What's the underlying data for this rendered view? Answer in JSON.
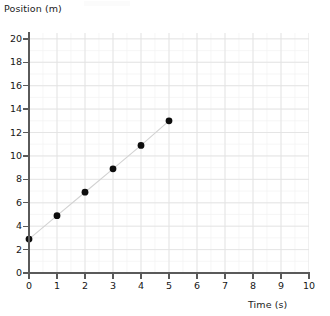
{
  "chart_data": {
    "type": "scatter",
    "title": "",
    "xlabel": "Time (s)",
    "ylabel": "Position (m)",
    "x": [
      0,
      1,
      2,
      3,
      4,
      5
    ],
    "values": [
      2.9,
      4.9,
      6.9,
      8.9,
      10.9,
      13.0
    ],
    "series": [
      {
        "name": "Position",
        "x": [
          0,
          1,
          2,
          3,
          4,
          5
        ],
        "values": [
          2.9,
          4.9,
          6.9,
          8.9,
          10.9,
          13.0
        ]
      }
    ],
    "xlim": [
      0,
      10
    ],
    "ylim": [
      0,
      20.5
    ],
    "xticks": [
      0,
      1,
      2,
      3,
      4,
      5,
      6,
      7,
      8,
      9,
      10
    ],
    "yticks": [
      0,
      2,
      4,
      6,
      8,
      10,
      12,
      14,
      16,
      18,
      20
    ],
    "xtick_labels": [
      "0",
      "1",
      "2",
      "3",
      "4",
      "5",
      "6",
      "7",
      "8",
      "9",
      "10"
    ],
    "ytick_labels": [
      "0",
      "2",
      "4",
      "6",
      "8",
      "10",
      "12",
      "14",
      "16",
      "18",
      "20"
    ],
    "grid": true,
    "grid_minor": true,
    "legend": null,
    "legend_position": "none",
    "connected": true,
    "marker": "circle",
    "marker_color": "#0d0d0d",
    "line_color": "#d2d2d2",
    "grid_color": "#e3e3e3",
    "axis_color": "#5a5a5a",
    "background_color": "#ffffff"
  },
  "axes": {
    "y_title": "Position (m)",
    "x_title": "Time (s)"
  }
}
